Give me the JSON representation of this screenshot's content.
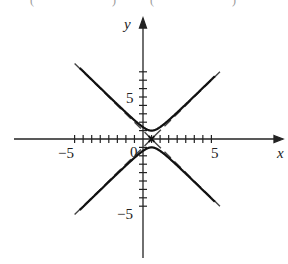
{
  "header_fragment": {
    "left": "(",
    "mid1": ")",
    "mid2": "(",
    "right": ")"
  },
  "axes": {
    "x_label": "x",
    "y_label": "y",
    "origin_label": "0",
    "x_tick_labels": [
      {
        "value": -5,
        "text": "−5"
      },
      {
        "value": 5,
        "text": "5"
      }
    ],
    "y_tick_labels": [
      {
        "value": 5,
        "text": "5"
      },
      {
        "value": -5,
        "text": "−5"
      }
    ]
  },
  "chart_data": {
    "type": "line",
    "title": "",
    "xlabel": "x",
    "ylabel": "y",
    "xlim": [
      -8.5,
      8.5
    ],
    "ylim": [
      -11.5,
      11.5
    ],
    "x_ticks": [
      -8,
      -7,
      -6,
      -5,
      -4,
      -3,
      -2,
      -1,
      1,
      2,
      3,
      4,
      5,
      6,
      7,
      8
    ],
    "y_ticks": [
      -8,
      -7,
      -6,
      -5,
      -4,
      -3,
      -2,
      -1,
      1,
      2,
      3,
      4,
      5,
      6,
      7,
      8
    ],
    "labeled_x_ticks": [
      -5,
      0,
      5
    ],
    "labeled_y_ticks": [
      -5,
      5
    ],
    "grid": false,
    "legend": null,
    "center_marker": {
      "x": 1,
      "y": 0,
      "symbol": "x"
    },
    "series": [
      {
        "name": "hyperbola upper branch",
        "style": "solid",
        "equation": "y = sqrt(1 + (x-1)^2)",
        "x": [
          -7,
          -6,
          -5,
          -4,
          -3,
          -2,
          -1,
          0,
          1,
          2,
          3,
          4,
          5,
          6,
          7,
          8
        ],
        "values": [
          8.06,
          7.07,
          6.08,
          5.1,
          4.12,
          3.16,
          2.24,
          1.41,
          1.0,
          1.41,
          2.24,
          3.16,
          4.12,
          5.1,
          6.08,
          7.07
        ]
      },
      {
        "name": "hyperbola lower branch",
        "style": "solid",
        "equation": "y = -sqrt(1 + (x-1)^2)",
        "x": [
          -7,
          -6,
          -5,
          -4,
          -3,
          -2,
          -1,
          0,
          1,
          2,
          3,
          4,
          5,
          6,
          7,
          8
        ],
        "values": [
          -8.06,
          -7.07,
          -6.08,
          -5.1,
          -4.12,
          -3.16,
          -2.24,
          -1.41,
          -1.0,
          -1.41,
          -2.24,
          -3.16,
          -4.12,
          -5.1,
          -6.08,
          -7.07
        ]
      },
      {
        "name": "asymptote y = x - 1",
        "style": "dashed",
        "x": [
          -8,
          9
        ],
        "values": [
          -9,
          8
        ]
      },
      {
        "name": "asymptote y = -(x - 1)",
        "style": "dashed",
        "x": [
          -8,
          9
        ],
        "values": [
          9,
          -8
        ]
      }
    ]
  }
}
